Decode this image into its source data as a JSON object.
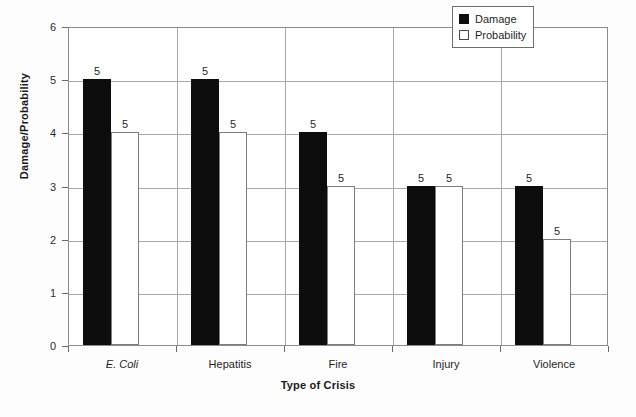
{
  "chart_data": {
    "type": "bar",
    "title": "",
    "xlabel": "Type of Crisis",
    "ylabel": "Damage/Probability",
    "categories": [
      "E. Coli",
      "Hepatitis",
      "Fire",
      "Injury",
      "Violence"
    ],
    "ylim": [
      0,
      6
    ],
    "yticks": [
      0,
      1,
      2,
      3,
      4,
      5,
      6
    ],
    "grid": true,
    "legend_position": "top-right",
    "series": [
      {
        "name": "Damage",
        "color": "#0d0d0d",
        "values": [
          5,
          5,
          4,
          3,
          3
        ],
        "data_labels": [
          "5",
          "5",
          "5",
          "5",
          "5"
        ]
      },
      {
        "name": "Probability",
        "color": "#ffffff",
        "values": [
          4,
          4,
          3,
          3,
          2
        ],
        "data_labels": [
          "5",
          "5",
          "5",
          "5",
          "5"
        ]
      }
    ]
  },
  "axis": {
    "y_tick_labels": [
      "0",
      "1",
      "2",
      "3",
      "4",
      "5",
      "6"
    ],
    "x_tick_labels": [
      "E. Coli",
      "Hepatitis",
      "Fire",
      "Injury",
      "Violence"
    ],
    "x_title": "Type of Crisis",
    "y_title": "Damage/Probability"
  },
  "legend": {
    "items": [
      {
        "label": "Damage",
        "swatch": "filled-square-icon"
      },
      {
        "label": "Probability",
        "swatch": "hollow-square-icon"
      }
    ]
  }
}
